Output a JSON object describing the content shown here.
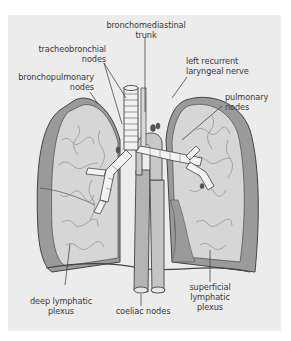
{
  "figure": {
    "labels": {
      "bronchomediastinal_trunk": {
        "line1": "bronchomediastinal",
        "line2": "trunk"
      },
      "tracheobronchial_nodes": {
        "line1": "tracheobronchial",
        "line2": "nodes"
      },
      "left_recurrent_laryngeal_nerve": {
        "line1": "left recurrent",
        "line2": "laryngeal nerve"
      },
      "bronchopulmonary_nodes": {
        "line1": "bronchopulmonary",
        "line2": "nodes"
      },
      "pulmonary_nodes": {
        "line1": "pulmonary",
        "line2": "nodes"
      },
      "deep_lymphatic_plexus": {
        "line1": "deep lymphatic",
        "line2": "plexus"
      },
      "coeliac_nodes": {
        "line1": "coeliac nodes"
      },
      "superficial_lymphatic_plexus": {
        "line1": "superficial",
        "line2": "lymphatic",
        "line3": "plexus"
      }
    },
    "colors": {
      "panel_background": "#ececec",
      "lung_fill": "#d6d6d6",
      "pleura_fill": "#9a9a9a",
      "vessel_fill": "#b4b4b4",
      "trachea_fill": "#f2f2f2",
      "outline": "#444444",
      "label_text": "#3a3a3a"
    }
  }
}
